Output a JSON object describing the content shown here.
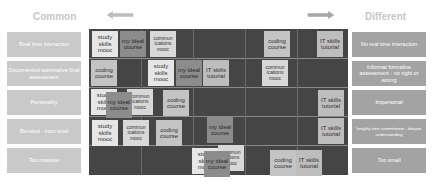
{
  "headings": {
    "left": "Common",
    "right": "Different"
  },
  "arrows": {
    "left": "arrow-left",
    "right": "arrow-right"
  },
  "rows": [
    {
      "left": "Real time interaction",
      "right": "No real time interaction"
    },
    {
      "left": "Documented summative final assessment",
      "right": "Informal formative assessment - no right or wrong"
    },
    {
      "left": "Personality",
      "right": "Impersonal"
    },
    {
      "left": "Blended - intro level",
      "right": "lengthy time commitment - deeper understanding"
    },
    {
      "left": "Too massive",
      "right": "Too small"
    }
  ],
  "cards": [
    {
      "label": "study skills mooc",
      "type": "study",
      "x": 92,
      "y": 31
    },
    {
      "label": "my ideal course",
      "type": "ideal",
      "x": 120,
      "y": 31
    },
    {
      "label": "commun ications mooc",
      "type": "comm",
      "x": 150,
      "y": 31
    },
    {
      "label": "coding course",
      "type": "code",
      "x": 264,
      "y": 31
    },
    {
      "label": "IT skills tutorial",
      "type": "it",
      "x": 317,
      "y": 31
    },
    {
      "label": "coding course",
      "type": "code",
      "x": 91,
      "y": 60
    },
    {
      "label": "study skills mooc",
      "type": "study",
      "x": 148,
      "y": 60
    },
    {
      "label": "my ideal course",
      "type": "ideal",
      "x": 176,
      "y": 60
    },
    {
      "label": "IT skills tutorial",
      "type": "it",
      "x": 203,
      "y": 60
    },
    {
      "label": "commun ications mooc",
      "type": "comm",
      "x": 262,
      "y": 60
    },
    {
      "label": "study skills mooc",
      "type": "study",
      "x": 91,
      "y": 89
    },
    {
      "label": "commun ications mooc",
      "type": "comm",
      "x": 127,
      "y": 89
    },
    {
      "label": "my ideal course",
      "type": "ideal",
      "x": 106,
      "y": 92
    },
    {
      "label": "coding course",
      "type": "code",
      "x": 163,
      "y": 90
    },
    {
      "label": "IT skills tutorial",
      "type": "it",
      "x": 318,
      "y": 90
    },
    {
      "label": "study skills mooc",
      "type": "study",
      "x": 92,
      "y": 120
    },
    {
      "label": "commun ications mooc",
      "type": "comm",
      "x": 123,
      "y": 120
    },
    {
      "label": "coding course",
      "type": "code",
      "x": 156,
      "y": 120
    },
    {
      "label": "my ideal course",
      "type": "ideal",
      "x": 207,
      "y": 117
    },
    {
      "label": "IT skills tutorial",
      "type": "it",
      "x": 318,
      "y": 118
    },
    {
      "label": "study skills mooc",
      "type": "study",
      "x": 192,
      "y": 148
    },
    {
      "label": "commun ications mooc",
      "type": "comm",
      "x": 218,
      "y": 145
    },
    {
      "label": "my ideal course",
      "type": "ideal",
      "x": 204,
      "y": 151
    },
    {
      "label": "coding course",
      "type": "code",
      "x": 270,
      "y": 150
    },
    {
      "label": "IT skills tutorial",
      "type": "it",
      "x": 296,
      "y": 150
    }
  ]
}
